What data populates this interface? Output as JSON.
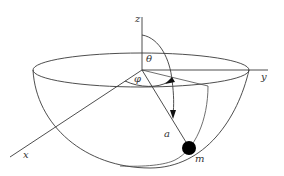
{
  "diagram": {
    "axes": {
      "z": {
        "label": "z"
      },
      "y": {
        "label": "y"
      },
      "x": {
        "label": "x"
      }
    },
    "angles": {
      "theta": {
        "label": "θ",
        "description": "polar angle measured from z-axis"
      },
      "phi": {
        "label": "φ",
        "description": "azimuthal angle measured from x-axis"
      }
    },
    "radius": {
      "label": "a"
    },
    "mass": {
      "label": "m",
      "color": "#000000"
    },
    "colors": {
      "stroke": "#3a3a3a",
      "background": "#ffffff"
    }
  }
}
